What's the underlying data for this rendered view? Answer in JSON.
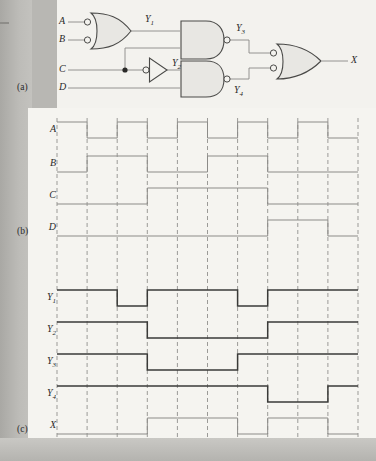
{
  "figure": {
    "panel_a_label": "(a)",
    "panel_b_label": "(b)",
    "panel_c_label": "(c)"
  },
  "circuit": {
    "inputs": [
      {
        "name": "A",
        "y": 22
      },
      {
        "name": "B",
        "y": 40
      },
      {
        "name": "C",
        "y": 70
      },
      {
        "name": "D",
        "y": 88
      }
    ],
    "output": {
      "name": "X"
    },
    "internal_nodes": [
      {
        "name": "Y",
        "sub": "1"
      },
      {
        "name": "Y",
        "sub": "2"
      },
      {
        "name": "Y",
        "sub": "3"
      },
      {
        "name": "Y",
        "sub": "4"
      }
    ],
    "gates": [
      {
        "id": "g1",
        "type": "or-gate-inverted-inputs",
        "inputs": [
          "A",
          "B"
        ],
        "output": "Y1"
      },
      {
        "id": "g2",
        "type": "inverter-bubbled-input",
        "inputs": [
          "C"
        ],
        "output": "Y2"
      },
      {
        "id": "g3",
        "type": "nand-gate",
        "inputs": [
          "Y1",
          "C"
        ],
        "output": "Y3"
      },
      {
        "id": "g4",
        "type": "nand-gate",
        "inputs": [
          "Y2",
          "D"
        ],
        "output": "Y4"
      },
      {
        "id": "g5",
        "type": "or-gate-inverted-inputs",
        "inputs": [
          "Y3",
          "Y4"
        ],
        "output": "X"
      }
    ],
    "junction_dot": true,
    "line_color": "#8a8986",
    "gate_fill": "#e8e7e3",
    "gate_stroke": "#4a4a48"
  },
  "timing": {
    "cycles": 10,
    "grid_color": "#9b9a97",
    "trace_color_input": "#8c8b88",
    "trace_color_derived": "#3a3a38",
    "trace_color_output": "#8c8b88",
    "signals": [
      {
        "label": "A",
        "sub": "",
        "kind": "input",
        "values": [
          1,
          0,
          1,
          0,
          1,
          0,
          1,
          0,
          1,
          0
        ]
      },
      {
        "label": "B",
        "sub": "",
        "kind": "input",
        "values": [
          0,
          1,
          1,
          0,
          0,
          1,
          1,
          0,
          0,
          0
        ]
      },
      {
        "label": "C",
        "sub": "",
        "kind": "input",
        "values": [
          0,
          0,
          0,
          1,
          1,
          1,
          1,
          0,
          0,
          0
        ]
      },
      {
        "label": "D",
        "sub": "",
        "kind": "input",
        "values": [
          0,
          0,
          0,
          0,
          0,
          0,
          0,
          1,
          1,
          0
        ]
      },
      {
        "label": "Y",
        "sub": "1",
        "kind": "derived",
        "values": [
          1,
          1,
          0,
          1,
          1,
          1,
          0,
          1,
          1,
          1
        ]
      },
      {
        "label": "Y",
        "sub": "2",
        "kind": "derived",
        "values": [
          1,
          1,
          1,
          0,
          0,
          0,
          0,
          1,
          1,
          1
        ]
      },
      {
        "label": "Y",
        "sub": "3",
        "kind": "derived",
        "values": [
          1,
          1,
          1,
          0,
          0,
          0,
          1,
          1,
          1,
          1
        ]
      },
      {
        "label": "Y",
        "sub": "4",
        "kind": "derived",
        "values": [
          1,
          1,
          1,
          1,
          1,
          1,
          1,
          0,
          0,
          1
        ]
      },
      {
        "label": "X",
        "sub": "",
        "kind": "output",
        "values": [
          0,
          0,
          0,
          1,
          1,
          1,
          0,
          1,
          1,
          0
        ]
      }
    ]
  }
}
